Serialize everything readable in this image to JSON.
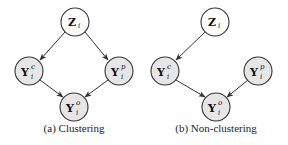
{
  "panels": [
    {
      "id": "a",
      "caption": "(a) Clustering",
      "nodes": {
        "z": {
          "main": "Z",
          "sup": "",
          "sub": "i",
          "observed": false
        },
        "yc": {
          "main": "Y",
          "sup": "c",
          "sub": "i",
          "observed": true
        },
        "yp": {
          "main": "Y",
          "sup": "p",
          "sub": "i",
          "observed": true
        },
        "yo": {
          "main": "Y",
          "sup": "o",
          "sub": "i",
          "observed": true
        }
      },
      "edges": [
        [
          "z",
          "yc"
        ],
        [
          "z",
          "yp"
        ],
        [
          "yc",
          "yo"
        ],
        [
          "yp",
          "yo"
        ]
      ]
    },
    {
      "id": "b",
      "caption": "(b) Non-clustering",
      "nodes": {
        "z": {
          "main": "Z",
          "sup": "",
          "sub": "i",
          "observed": false
        },
        "yc": {
          "main": "Y",
          "sup": "c",
          "sub": "i",
          "observed": true
        },
        "yp": {
          "main": "Y",
          "sup": "p",
          "sub": "i",
          "observed": true
        },
        "yo": {
          "main": "Y",
          "sup": "o",
          "sub": "i",
          "observed": true
        }
      },
      "edges": [
        [
          "z",
          "yc"
        ],
        [
          "yc",
          "yo"
        ],
        [
          "yp",
          "yo"
        ]
      ]
    }
  ],
  "colors": {
    "observed_fill": "#e6e6e6",
    "latent_fill": "#ffffff",
    "stroke": "#333333"
  }
}
